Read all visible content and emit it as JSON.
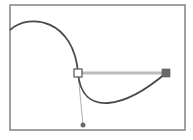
{
  "diagram": {
    "colors": {
      "background": "#ffffff",
      "frame": "#8a8a8a",
      "curve": "#4a4a4a",
      "handle_line_thick": "#bdbdbd",
      "handle_line_thin": "#9a9a9a",
      "anchor_fill": "#ffffff",
      "anchor_stroke": "#555555",
      "handle_square": "#6a6a6a",
      "handle_dot": "#6a6a6a"
    },
    "frame": {
      "x": 10,
      "y": 5,
      "width": 175,
      "height": 125
    },
    "curve_segments": [
      {
        "name": "upper-segment",
        "from": [
          10,
          30
        ],
        "c1": [
          30,
          12
        ],
        "c2": [
          74,
          20
        ],
        "to": [
          78,
          73
        ]
      },
      {
        "name": "lower-segment",
        "from": [
          78,
          73
        ],
        "c1": [
          82,
          118
        ],
        "c2": [
          125,
          108
        ],
        "to": [
          166,
          73
        ]
      }
    ],
    "anchor_point": {
      "x": 78,
      "y": 73,
      "size": 8,
      "selected": false
    },
    "direction_handles": [
      {
        "name": "horizontal-handle",
        "from": [
          78,
          73
        ],
        "to": [
          166,
          73
        ],
        "end_shape": "square",
        "end_size": 8
      },
      {
        "name": "vertical-handle",
        "from": [
          78,
          73
        ],
        "to": [
          83,
          125
        ],
        "end_shape": "dot",
        "end_radius": 2.5
      }
    ]
  }
}
